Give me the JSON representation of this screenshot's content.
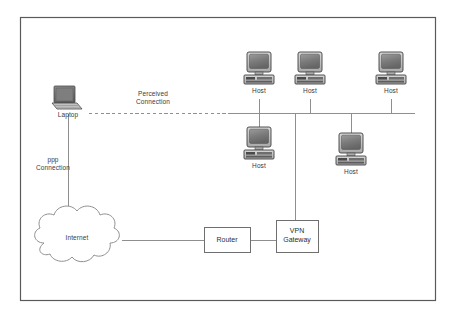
{
  "diagram": {
    "border": {
      "x": 20,
      "y": 17,
      "w": 416,
      "h": 284,
      "color": "#555555"
    },
    "line_color": "#8a8a8a",
    "monitor_screen_color": "#7d7d7d",
    "monitor_case_color": "#b9b9b9",
    "nodes": [
      {
        "id": "laptop",
        "type": "laptop",
        "label": "Laptop",
        "x": 60,
        "y": 88
      },
      {
        "id": "host1",
        "type": "desktop",
        "label": "Host",
        "x": 244,
        "y": 52
      },
      {
        "id": "host2",
        "type": "desktop",
        "label": "Host",
        "x": 295,
        "y": 52
      },
      {
        "id": "host3",
        "type": "desktop",
        "label": "Host",
        "x": 376,
        "y": 52
      },
      {
        "id": "host4",
        "type": "desktop",
        "label": "Host",
        "x": 244,
        "y": 122
      },
      {
        "id": "host5",
        "type": "desktop",
        "label": "Host",
        "x": 336,
        "y": 128
      }
    ],
    "clouds": [
      {
        "id": "internet",
        "label": "Internet",
        "cx": 77,
        "cy": 238
      }
    ],
    "boxes": [
      {
        "id": "router",
        "label": "Router",
        "x": 204,
        "y": 227,
        "w": 46,
        "h": 25
      },
      {
        "id": "vpn-gateway",
        "label": "VPN\nGateway",
        "x": 276,
        "y": 220,
        "w": 42,
        "h": 32
      }
    ],
    "edge_labels": [
      {
        "id": "perceived-connection",
        "text": "Perceived\nConnection",
        "x": 128,
        "y": 92
      },
      {
        "id": "ppp-connection",
        "text": "ppp\nConnection",
        "x": 28,
        "y": 158
      }
    ],
    "backbone": {
      "y": 113,
      "x1": 230,
      "x2": 415
    },
    "dashed_link": {
      "y": 113,
      "x1": 89,
      "x2": 231
    }
  }
}
